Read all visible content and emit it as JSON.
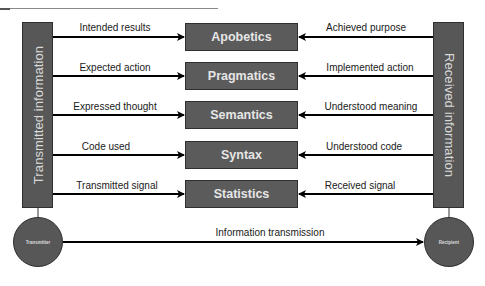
{
  "diagram": {
    "left_bar": {
      "label": "Transmitted information"
    },
    "right_bar": {
      "label": "Received information"
    },
    "layers": [
      {
        "name": "Apobetics",
        "left_label": "Intended results",
        "right_label": "Achieved purpose"
      },
      {
        "name": "Pragmatics",
        "left_label": "Expected action",
        "right_label": "Implemented action"
      },
      {
        "name": "Semantics",
        "left_label": "Expressed thought",
        "right_label": "Understood meaning"
      },
      {
        "name": "Syntax",
        "left_label": "Code used",
        "right_label": "Understood code"
      },
      {
        "name": "Statistics",
        "left_label": "Transmitted signal",
        "right_label": "Received signal"
      }
    ],
    "transmitter": {
      "label": "Transmitter"
    },
    "recipient": {
      "label": "Recipient"
    },
    "bottom_arrow": {
      "label": "Information transmission"
    },
    "colors": {
      "shape_fill": "#575757",
      "shape_border": "#2f2f2f",
      "shape_text": "#e6e6e6",
      "arrow": "#000000"
    }
  }
}
